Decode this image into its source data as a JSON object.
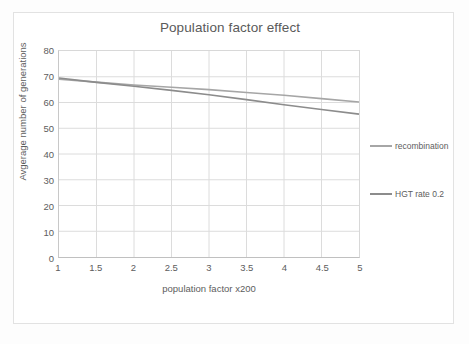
{
  "chart_data": {
    "type": "line",
    "title": "Population factor effect",
    "xlabel": "population factor x200",
    "ylabel": "Avgerage number of generations",
    "x": [
      1,
      1.5,
      2,
      2.5,
      3,
      3.5,
      4,
      4.5,
      5
    ],
    "xlim": [
      1,
      5
    ],
    "ylim": [
      0,
      80
    ],
    "xticks": [
      "1",
      "1.5",
      "2",
      "2.5",
      "3",
      "3.5",
      "4",
      "4.5",
      "5"
    ],
    "yticks": [
      "0",
      "10",
      "20",
      "30",
      "40",
      "50",
      "60",
      "70",
      "80"
    ],
    "grid": "both",
    "legend_position": "right",
    "series": [
      {
        "name": "recombination",
        "color": "#a6a6a6",
        "values": [
          69.0,
          67.9,
          66.8,
          65.9,
          65.0,
          63.9,
          62.8,
          61.5,
          60.2
        ]
      },
      {
        "name": "HGT rate 0.2",
        "color": "#8c8c8c",
        "values": [
          69.5,
          67.8,
          66.3,
          64.7,
          63.0,
          61.1,
          59.1,
          57.3,
          55.5
        ]
      }
    ]
  },
  "legend": {
    "entries": [
      {
        "label": "recombination"
      },
      {
        "label": "HGT rate 0.2"
      }
    ]
  }
}
